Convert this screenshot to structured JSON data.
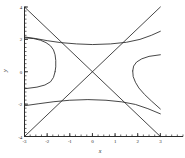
{
  "chart_data": {
    "type": "line",
    "title": "",
    "subtitle": "",
    "xlabel": "x",
    "ylabel": "y",
    "xlim": [
      -3,
      4
    ],
    "ylim": [
      -4,
      4
    ],
    "grid": false,
    "legend": "none",
    "x_ticks": [
      {
        "value": -3,
        "label": "-3"
      },
      {
        "value": -2,
        "label": "-2"
      },
      {
        "value": -1,
        "label": "-1"
      },
      {
        "value": 0,
        "label": "0"
      },
      {
        "value": 1,
        "label": "1"
      },
      {
        "value": 2,
        "label": "2"
      },
      {
        "value": 3,
        "label": "3"
      }
    ],
    "y_ticks": [
      {
        "value": 4,
        "label": "4"
      },
      {
        "value": 2,
        "label": "2"
      },
      {
        "value": 0,
        "label": "0"
      },
      {
        "value": -2,
        "label": "-2"
      },
      {
        "value": -4,
        "label": "-4"
      }
    ],
    "x_minor_tick_step": 0.25,
    "y_minor_tick_step": 0.25,
    "annotations": [],
    "series": [
      {
        "name": "asymptote-rising",
        "style": "solid-thin",
        "color": "#262626",
        "points": [
          [
            -3,
            -4
          ],
          [
            3,
            4
          ]
        ]
      },
      {
        "name": "asymptote-falling",
        "style": "solid-thin",
        "color": "#262626",
        "points": [
          [
            -3,
            4
          ],
          [
            3,
            -4
          ]
        ]
      },
      {
        "name": "hyperbola-left-upper",
        "style": "solid-thin",
        "color": "#262626",
        "points": [
          [
            -3,
            2.1
          ],
          [
            -2.6,
            2.05
          ],
          [
            -2.3,
            1.95
          ],
          [
            -2.05,
            1.8
          ],
          [
            -1.85,
            1.6
          ],
          [
            -1.72,
            1.35
          ],
          [
            -1.65,
            1.05
          ],
          [
            -1.62,
            0.7
          ],
          [
            -1.62,
            0.3
          ],
          [
            -1.65,
            0.0
          ]
        ]
      },
      {
        "name": "hyperbola-left-lower",
        "style": "solid-thin",
        "color": "#262626",
        "points": [
          [
            -1.65,
            0.0
          ],
          [
            -1.72,
            -0.35
          ],
          [
            -1.85,
            -0.62
          ],
          [
            -2.1,
            -0.82
          ],
          [
            -2.45,
            -0.95
          ],
          [
            -3,
            -1.05
          ]
        ]
      },
      {
        "name": "hyperbola-upper-left-branch",
        "style": "solid-thin",
        "color": "#262626",
        "points": [
          [
            -3,
            2.15
          ],
          [
            -2.5,
            2.05
          ],
          [
            -2.0,
            1.92
          ],
          [
            -1.4,
            1.8
          ],
          [
            -0.7,
            1.72
          ],
          [
            0,
            1.68
          ],
          [
            0.8,
            1.72
          ],
          [
            1.5,
            1.82
          ],
          [
            2.1,
            2.0
          ],
          [
            2.6,
            2.25
          ],
          [
            3,
            2.5
          ]
        ]
      },
      {
        "name": "hyperbola-lower-left-branch",
        "style": "solid-thin",
        "color": "#262626",
        "points": [
          [
            -3,
            -2.1
          ],
          [
            -2.4,
            -1.98
          ],
          [
            -1.7,
            -1.85
          ],
          [
            -1.0,
            -1.76
          ],
          [
            -0.2,
            -1.72
          ],
          [
            0.6,
            -1.76
          ],
          [
            1.3,
            -1.86
          ],
          [
            1.9,
            -2.02
          ],
          [
            2.45,
            -2.28
          ],
          [
            3,
            -2.6
          ]
        ]
      },
      {
        "name": "hyperbola-right-upper",
        "style": "solid-thin",
        "color": "#262626",
        "points": [
          [
            3,
            1.05
          ],
          [
            2.5,
            0.95
          ],
          [
            2.18,
            0.8
          ],
          [
            1.95,
            0.6
          ],
          [
            1.82,
            0.35
          ],
          [
            1.78,
            0.05
          ]
        ]
      },
      {
        "name": "hyperbola-right-lower",
        "style": "solid-thin",
        "color": "#262626",
        "points": [
          [
            1.78,
            0.05
          ],
          [
            1.8,
            -0.3
          ],
          [
            1.9,
            -0.65
          ],
          [
            2.05,
            -1.0
          ],
          [
            2.3,
            -1.4
          ],
          [
            2.6,
            -1.8
          ],
          [
            3,
            -2.3
          ]
        ]
      }
    ]
  },
  "axes": {
    "x_axis_label": "x",
    "y_axis_label": "y"
  }
}
